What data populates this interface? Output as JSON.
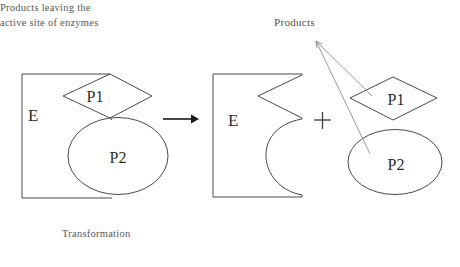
{
  "diagram": {
    "title_label": "Products",
    "canvas": {
      "width": 460,
      "height": 267,
      "background": "#ffffff"
    },
    "colors": {
      "shape_stroke": "#4a4a4a",
      "leader_line": "#8c8c96",
      "arrow": "#1b1b1b",
      "label_text": "#2a2a2a",
      "caption_text": "#58585e"
    },
    "left_group": {
      "enzyme_label": "E",
      "substrate_diamond_label": "P1",
      "substrate_ellipse_label": "P2",
      "caption": "Transformation"
    },
    "operator_arrow": "→",
    "operator_plus": "+",
    "right_group": {
      "enzyme_label": "E",
      "product_diamond_label": "P1",
      "product_ellipse_label": "P2",
      "caption_line_1": "Products leaving the",
      "caption_line_2": "active site of enzymes"
    }
  }
}
